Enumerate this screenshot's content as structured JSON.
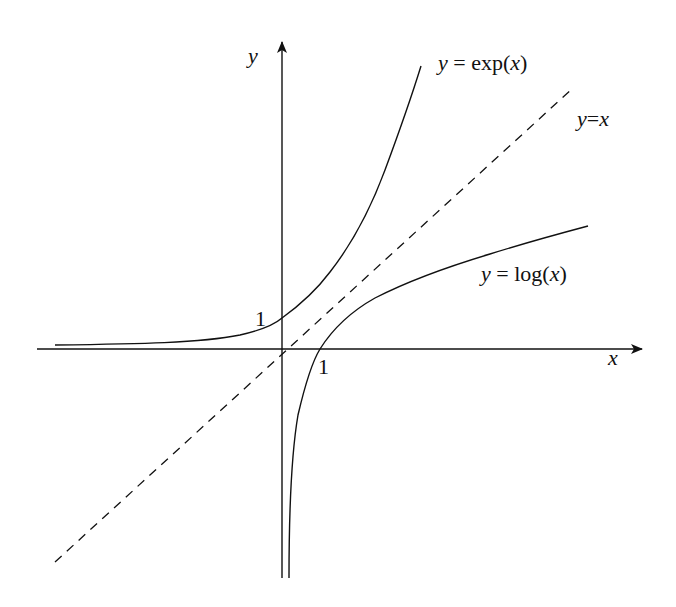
{
  "figure": {
    "axes": {
      "x_label": "x",
      "y_label": "y"
    },
    "curves": [
      {
        "id": "exp",
        "label_var": "y",
        "label_eq": " = exp(",
        "label_arg": "x",
        "label_close": ")",
        "style": "solid"
      },
      {
        "id": "log",
        "label_var": "y",
        "label_eq": " = log(",
        "label_arg": "x",
        "label_close": ")",
        "style": "solid"
      },
      {
        "id": "identity",
        "label_var": "y",
        "label_eq": "=",
        "label_arg": "x",
        "label_close": "",
        "style": "dashed"
      }
    ],
    "annotations": {
      "y_intercept_exp": "1",
      "x_intercept_log": "1"
    },
    "colors": {
      "ink": "#111111",
      "background": "#ffffff"
    }
  }
}
